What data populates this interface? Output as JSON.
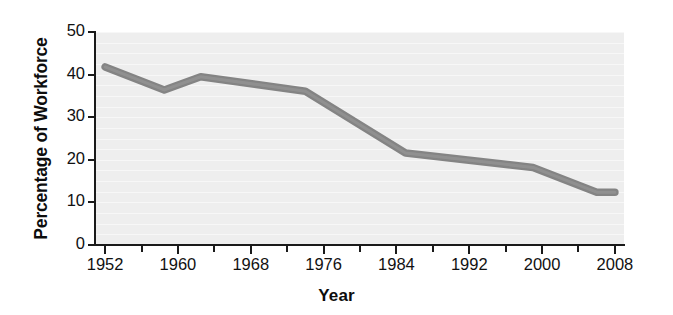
{
  "chart_data": {
    "type": "line",
    "title": "",
    "xlabel": "Year",
    "ylabel": "Percentage of Workforce",
    "xlim": [
      1951,
      2009
    ],
    "ylim": [
      0,
      50
    ],
    "grid": true,
    "legend": "none",
    "line_color": "#848484",
    "background_color": "#eeeeee",
    "axis_color": "#1a1a1a",
    "x_ticks": [
      1952,
      1956,
      1960,
      1964,
      1968,
      1972,
      1976,
      1980,
      1984,
      1988,
      1992,
      1996,
      2000,
      2004,
      2008
    ],
    "x_tick_labels": [
      "1952",
      "",
      "1960",
      "",
      "1968",
      "",
      "1976",
      "",
      "1984",
      "",
      "1992",
      "",
      "2000",
      "",
      "2008"
    ],
    "y_ticks": [
      0,
      10,
      20,
      30,
      40,
      50
    ],
    "y_tick_labels": [
      "0",
      "10",
      "20",
      "30",
      "40",
      "50"
    ],
    "series": [
      {
        "name": "Percentage of Workforce",
        "x": [
          1952,
          1958.5,
          1962.5,
          1974,
          1985,
          1999,
          2006,
          2008
        ],
        "values": [
          41.8,
          36.4,
          39.5,
          36.1,
          21.6,
          18.2,
          12.4,
          12.4
        ]
      }
    ]
  }
}
